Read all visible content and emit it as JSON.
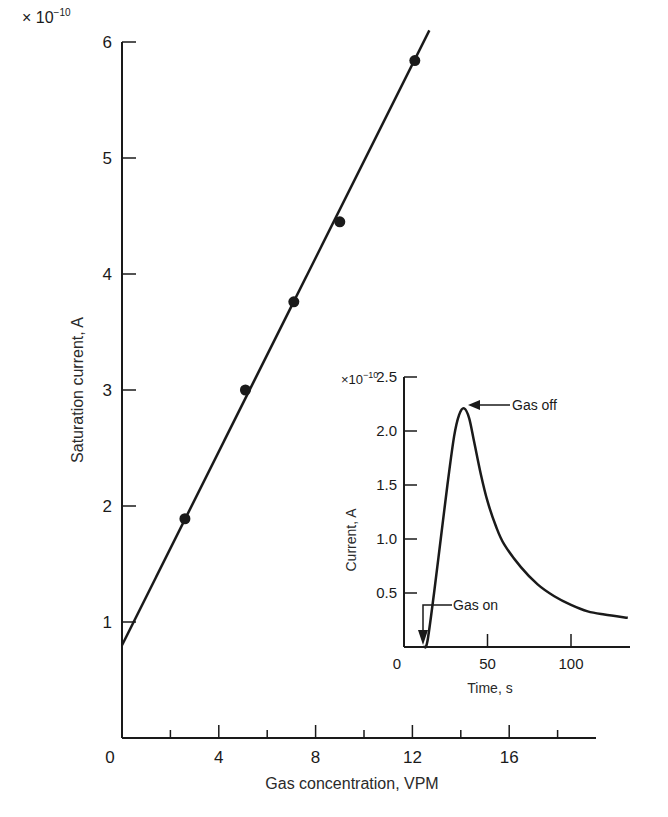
{
  "chart_data": [
    {
      "type": "scatter",
      "title": "",
      "xlabel": "Gas concentration, VPM",
      "ylabel": "Saturation current, A",
      "y_multiplier": "× 10",
      "y_multiplier_exp": "−10",
      "xlim": [
        0,
        19
      ],
      "ylim": [
        0,
        6
      ],
      "x_ticks": [
        "0",
        "4",
        "8",
        "12",
        "16"
      ],
      "x_minor_ticks": [
        2,
        6,
        10,
        14,
        18
      ],
      "y_ticks": [
        "1",
        "2",
        "3",
        "4",
        "5",
        "6"
      ],
      "grid": false,
      "series": [
        {
          "name": "measured",
          "x": [
            2.6,
            5.1,
            7.1,
            9.0,
            12.1
          ],
          "y": [
            1.89,
            3.0,
            3.76,
            4.45,
            5.84
          ]
        },
        {
          "name": "linear fit",
          "x": [
            0,
            12.7
          ],
          "y": [
            0.8,
            6.1
          ]
        }
      ]
    },
    {
      "type": "line",
      "title": "",
      "xlabel": "Time, s",
      "ylabel": "Current, A",
      "y_multiplier": "×10",
      "y_multiplier_exp": "−10",
      "xlim": [
        0,
        135
      ],
      "ylim": [
        0,
        2.5
      ],
      "x_ticks": [
        "0",
        "50",
        "100"
      ],
      "y_ticks": [
        "0.5",
        "1.0",
        "1.5",
        "2.0",
        "2.5"
      ],
      "grid": false,
      "series": [
        {
          "name": "current response",
          "x": [
            12,
            14,
            18,
            22,
            26,
            30,
            33,
            36,
            39,
            42,
            46,
            50,
            55,
            60,
            70,
            80,
            90,
            100,
            110,
            120,
            134
          ],
          "y": [
            0.0,
            0.05,
            0.5,
            1.0,
            1.5,
            1.95,
            2.15,
            2.21,
            2.12,
            1.9,
            1.6,
            1.35,
            1.12,
            0.95,
            0.74,
            0.58,
            0.47,
            0.39,
            0.33,
            0.3,
            0.27
          ]
        }
      ],
      "annotations": [
        {
          "text": "Gas off",
          "x": 36,
          "y": 2.21
        },
        {
          "text": "Gas on",
          "x": 12,
          "y": 0.0
        }
      ]
    }
  ]
}
